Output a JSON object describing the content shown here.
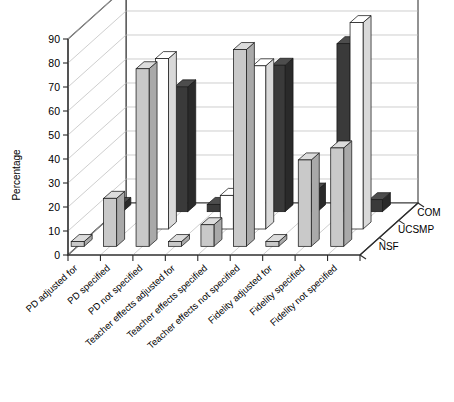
{
  "chart_data": {
    "type": "bar",
    "title": "",
    "subtitle": "",
    "xlabel": "",
    "ylabel": "Percentage",
    "zlabel": "",
    "ylim": [
      0,
      90
    ],
    "ytick_step": 10,
    "yticks": [
      "0",
      "10",
      "20",
      "30",
      "40",
      "50",
      "60",
      "70",
      "80",
      "90"
    ],
    "grid": true,
    "projection": "3d",
    "legend_position": "right-depth-axis",
    "categories": [
      "PD adjusted for",
      "PD specified",
      "PD not specified",
      "Teacher effects adjusted for",
      "Teacher effects specified",
      "Teacher effects not specified",
      "Fidelity adjusted for",
      "Fidelity specified",
      "Fidelity not specified"
    ],
    "depth_categories": [
      "COM",
      "UCSMP",
      "NSF"
    ],
    "series": [
      {
        "name": "NSF",
        "fill": "#c9c9c9",
        "values": [
          2,
          20,
          74,
          2,
          9,
          82,
          2,
          36,
          41
        ]
      },
      {
        "name": "UCSMP",
        "fill": "#ffffff",
        "values": [
          0,
          0,
          71,
          0,
          14,
          68,
          0,
          0,
          86
        ]
      },
      {
        "name": "COM",
        "fill": "#3a3a3a",
        "values": [
          3,
          52,
          52,
          3,
          36,
          61,
          9,
          70,
          5
        ]
      }
    ]
  },
  "colors": {
    "nsf": "#c9c9c9",
    "ucsmp": "#ffffff",
    "com": "#3a3a3a",
    "grid": "#b9b9b9",
    "axis": "#2b2b2b",
    "background": "#ffffff"
  }
}
